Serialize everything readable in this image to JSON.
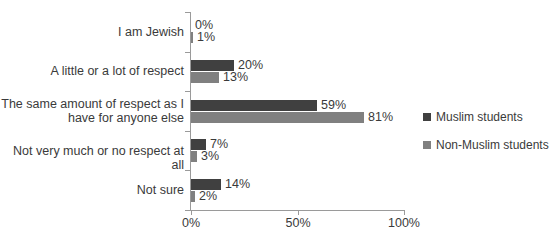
{
  "chart_data": {
    "type": "bar",
    "orientation": "horizontal",
    "title": "",
    "xlabel": "",
    "ylabel": "",
    "xlim": [
      0,
      100
    ],
    "xticks": [
      "0%",
      "50%",
      "100%"
    ],
    "xtick_values": [
      0,
      50,
      100
    ],
    "grid": false,
    "legend_position": "right",
    "categories": [
      "I am Jewish",
      "A little or a lot of respect",
      "The same amount of respect as I\nhave for anyone else",
      "Not very much or no respect at all",
      "Not sure"
    ],
    "series": [
      {
        "name": "Muslim students",
        "color": "#404040",
        "values": [
          0,
          20,
          59,
          7,
          14
        ],
        "labels": [
          "0%",
          "20%",
          "59%",
          "7%",
          "14%"
        ]
      },
      {
        "name": "Non-Muslim students",
        "color": "#808080",
        "values": [
          1,
          13,
          81,
          3,
          2
        ],
        "labels": [
          "1%",
          "13%",
          "81%",
          "3%",
          "2%"
        ]
      }
    ]
  },
  "legend": {
    "items": [
      {
        "label": "Muslim students",
        "color": "#404040"
      },
      {
        "label": "Non-Muslim students",
        "color": "#808080"
      }
    ]
  },
  "axis": {
    "line_color": "#9a9a9a"
  }
}
